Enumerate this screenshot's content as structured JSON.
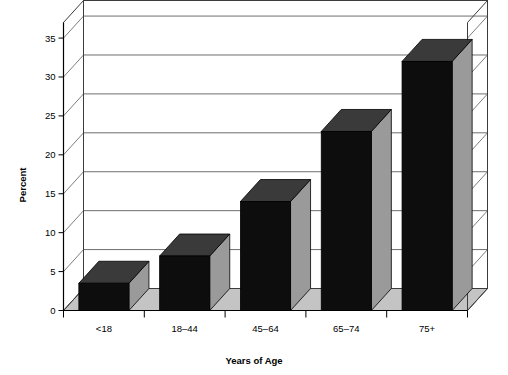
{
  "chart_data": {
    "type": "bar",
    "title": "",
    "subtitle": "",
    "xlabel": "Years of Age",
    "ylabel": "Percent",
    "categories": [
      "<18",
      "18–44",
      "45–64",
      "65–74",
      "75+"
    ],
    "values": [
      3.5,
      7,
      14,
      23,
      32
    ],
    "series": [
      {
        "name": "Percent",
        "values": [
          3.5,
          7,
          14,
          23,
          32
        ]
      }
    ],
    "ylim": [
      0,
      37
    ],
    "yticks": [
      0,
      5,
      10,
      15,
      20,
      25,
      30,
      35
    ],
    "ytick_labels": [
      "0",
      "5",
      "10",
      "15",
      "20",
      "25",
      "30",
      "35"
    ],
    "grid": "horizontal",
    "legend": "none",
    "style": "3d-bar",
    "annotations": []
  },
  "colors": {
    "background": "#ffffff",
    "bar_front": "#0d0d0d",
    "bar_top": "#3a3a3a",
    "bar_side": "#9a9a9a",
    "floor": "#c4c4c4",
    "wall": "#ffffff",
    "gridline": "#6e6e6e",
    "axis": "#3c3c3c",
    "text": "#000000"
  },
  "icons": {
    "chart": "bar-chart-icon"
  }
}
